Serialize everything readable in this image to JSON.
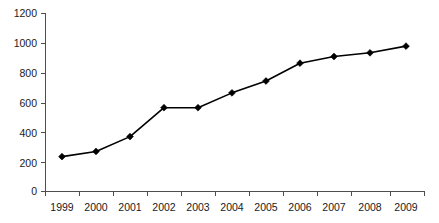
{
  "chart_data": {
    "type": "line",
    "title": "",
    "subtitle": "",
    "xlabel": "",
    "ylabel": "",
    "categories": [
      "1999",
      "2000",
      "2001",
      "2002",
      "2003",
      "2004",
      "2005",
      "2006",
      "2007",
      "2008",
      "2009"
    ],
    "values": [
      235,
      270,
      370,
      565,
      565,
      665,
      745,
      865,
      910,
      935,
      980
    ],
    "series": [
      {
        "name": "",
        "values": [
          235,
          270,
          370,
          565,
          565,
          665,
          745,
          865,
          910,
          935,
          980
        ]
      }
    ],
    "ylim": [
      0,
      1200
    ],
    "y_ticks": [
      0,
      200,
      400,
      600,
      800,
      1000,
      1200
    ],
    "y_tick_labels": [
      "0",
      "200",
      "400",
      "600",
      "800",
      "1000",
      "1200"
    ],
    "x_tick_labels": [
      "1999",
      "2000",
      "2001",
      "2002",
      "2003",
      "2004",
      "2005",
      "2006",
      "2007",
      "2008",
      "2009"
    ],
    "grid": false,
    "legend": false,
    "legend_position": "none",
    "marker": "diamond",
    "line_color": "#000000",
    "marker_color": "#000000",
    "axis_color": "#4d4d4d",
    "background_color": "#ffffff",
    "annotations": []
  },
  "axis": {
    "y_labels": [
      "1200",
      "1000",
      "800",
      "600",
      "400",
      "200",
      "0"
    ],
    "x_labels": [
      "1999",
      "2000",
      "2001",
      "2002",
      "2003",
      "2004",
      "2005",
      "2006",
      "2007",
      "2008",
      "2009"
    ]
  }
}
